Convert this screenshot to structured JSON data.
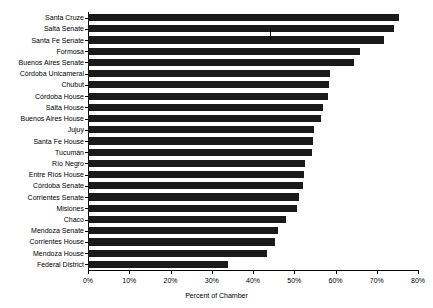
{
  "chart_data": {
    "type": "bar",
    "orientation": "horizontal",
    "title": "",
    "xlabel": "Percent of Chamber",
    "ylabel": "",
    "xlim": [
      0,
      80
    ],
    "xticks": [
      "0%",
      "10%",
      "20%",
      "30%",
      "40%",
      "50%",
      "60%",
      "70%",
      "80%"
    ],
    "xtick_values": [
      0,
      10,
      20,
      30,
      40,
      50,
      60,
      70,
      80
    ],
    "grid": false,
    "legend": null,
    "bar_color": "#1a1a1a",
    "categories": [
      "Santa Cruze",
      "Salta Senate",
      "Santa Fe Senate",
      "Formosa",
      "Buenos Aires Senate",
      "Córdoba Unicameral",
      "Chubut",
      "Córdoba House",
      "Salta House",
      "Buenos Aires House",
      "Jujuy",
      "Santa Fe House",
      "Tucumán",
      "Río Negro",
      "Entre Ríos House",
      "Córdoba Senate",
      "Corrientes Senate",
      "Misiones",
      "Chaco",
      "Mendoza Senate",
      "Corrientes House",
      "Mendoza House",
      "Federal District"
    ],
    "values": [
      75.4,
      74.2,
      71.8,
      66.0,
      64.5,
      58.6,
      58.4,
      58.2,
      57.0,
      56.4,
      54.8,
      54.5,
      54.2,
      52.6,
      52.4,
      52.1,
      51.2,
      50.6,
      48.0,
      46.1,
      45.3,
      43.5,
      33.9
    ]
  },
  "axis": {
    "x_title": "Percent of Chamber"
  }
}
